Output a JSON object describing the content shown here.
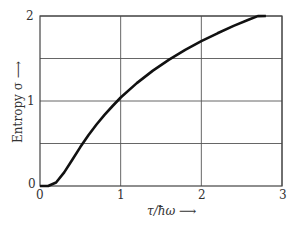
{
  "chart_data": {
    "type": "line",
    "title": "",
    "xlabel": "τ/ħω",
    "ylabel": "Entropy σ",
    "xlim": [
      0,
      3
    ],
    "ylim": [
      0,
      2
    ],
    "grid": true,
    "x_ticks": [
      "0",
      "1",
      "2",
      "3"
    ],
    "y_ticks": [
      "0",
      "1",
      "2"
    ],
    "y_gridlines": [
      0.5,
      1,
      1.5,
      2
    ],
    "x_gridlines": [
      1,
      2,
      3
    ],
    "series": [
      {
        "name": "Entropy σ",
        "x": [
          0,
          0.1,
          0.2,
          0.3,
          0.4,
          0.5,
          0.6,
          0.7,
          0.8,
          0.9,
          1.0,
          1.2,
          1.4,
          1.6,
          1.8,
          2.0,
          2.2,
          2.4,
          2.6,
          2.7,
          2.8
        ],
        "y": [
          0,
          0.0005,
          0.041,
          0.16,
          0.309,
          0.458,
          0.597,
          0.723,
          0.837,
          0.941,
          1.041,
          1.211,
          1.358,
          1.486,
          1.601,
          1.704,
          1.797,
          1.883,
          1.962,
          1.999,
          2.0
        ]
      }
    ]
  },
  "labels": {
    "xlabel": "τ/ħω ⟶",
    "ylabel": "Entropy σ ⟶",
    "xtick0": "0",
    "xtick1": "1",
    "xtick2": "2",
    "xtick3": "3",
    "ytick0": "0",
    "ytick1": "1",
    "ytick2": "2"
  },
  "colors": {
    "curve": "#111111",
    "grid": "#555555",
    "axis": "#444444"
  }
}
